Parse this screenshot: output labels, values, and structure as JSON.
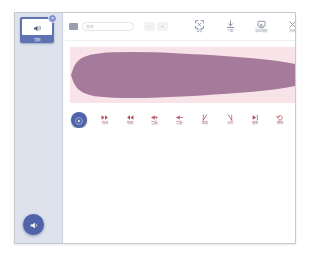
{
  "window": {
    "title": "音频编辑"
  },
  "sidebar": {
    "thumbnail": {
      "name": "audio-clip-thumbnail",
      "icon": "speaker-icon",
      "caption": "音频",
      "badge": "×",
      "selected": true
    },
    "add_button": {
      "label": "添加音频",
      "icon": "speaker-add-icon"
    }
  },
  "toolbar": {
    "lead_icon": "list-icon",
    "search": {
      "value": "",
      "placeholder": "搜索"
    },
    "steppers": [
      {
        "name": "zoom-out-button",
        "glyph": "−"
      },
      {
        "name": "zoom-in-button",
        "glyph": "+"
      }
    ],
    "actions": [
      {
        "name": "fit-screen-button",
        "icon": "fit-screen-icon",
        "label": "全屏"
      },
      {
        "name": "download-button",
        "icon": "download-icon",
        "label": "下载"
      },
      {
        "name": "export-button",
        "icon": "export-icon",
        "label": "导出视频"
      },
      {
        "name": "close-button",
        "icon": "close-icon",
        "label": "关闭"
      }
    ]
  },
  "track": {
    "name": "audio-waveform-track",
    "background_color": "#f8e3e8",
    "waveform_color": "#a57a9b",
    "waveform_points": [
      [
        2,
        50
      ],
      [
        6,
        38
      ],
      [
        12,
        28
      ],
      [
        20,
        21
      ],
      [
        32,
        16
      ],
      [
        48,
        12
      ],
      [
        70,
        10
      ],
      [
        100,
        9
      ],
      [
        140,
        9
      ],
      [
        180,
        10
      ],
      [
        230,
        12
      ],
      [
        280,
        15
      ],
      [
        330,
        18
      ],
      [
        380,
        22
      ],
      [
        420,
        27
      ],
      [
        450,
        33
      ],
      [
        466,
        41
      ],
      [
        470,
        50
      ],
      [
        466,
        59
      ],
      [
        450,
        67
      ],
      [
        420,
        73
      ],
      [
        380,
        78
      ],
      [
        330,
        82
      ],
      [
        280,
        85
      ],
      [
        230,
        88
      ],
      [
        180,
        90
      ],
      [
        140,
        91
      ],
      [
        100,
        91
      ],
      [
        70,
        90
      ],
      [
        48,
        88
      ],
      [
        32,
        84
      ],
      [
        20,
        79
      ],
      [
        12,
        72
      ],
      [
        6,
        62
      ],
      [
        2,
        50
      ]
    ]
  },
  "controls": {
    "play_button": {
      "name": "play-button",
      "icon": "play-icon"
    },
    "tools": [
      {
        "name": "tool-forward",
        "icon": "fast-forward-icon",
        "label": "快进"
      },
      {
        "name": "tool-rewind",
        "icon": "rewind-icon",
        "label": "快退"
      },
      {
        "name": "tool-volume-up",
        "icon": "volume-up-icon",
        "label": "音量+"
      },
      {
        "name": "tool-volume-down",
        "icon": "volume-down-icon",
        "label": "音量−"
      },
      {
        "name": "tool-cut-left",
        "icon": "cut-left-icon",
        "label": "裁剪"
      },
      {
        "name": "tool-cut-right",
        "icon": "cut-right-icon",
        "label": "分割"
      },
      {
        "name": "tool-play-head",
        "icon": "play-head-icon",
        "label": "播放"
      },
      {
        "name": "tool-undo",
        "icon": "undo-icon",
        "label": "撤销"
      },
      {
        "name": "tool-delete",
        "icon": "delete-icon",
        "label": "删除音频"
      }
    ]
  }
}
